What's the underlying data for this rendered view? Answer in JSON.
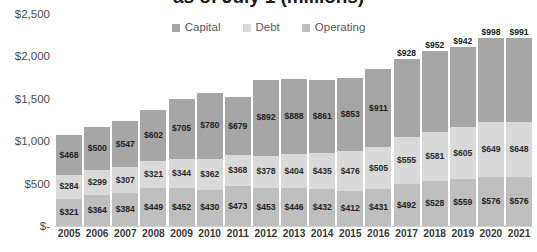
{
  "chart_data": {
    "type": "bar",
    "stacked": true,
    "title": "as of July 1 (millions)",
    "xlabel": "",
    "ylabel": "",
    "ylim": [
      0,
      2500
    ],
    "yticks": [
      0,
      500,
      1000,
      1500,
      2000,
      2500
    ],
    "ytick_labels": [
      "$-",
      "$500",
      "$1,000",
      "$1,500",
      "$2,000",
      "$2,500"
    ],
    "grid": false,
    "legend_position": "top-center",
    "categories": [
      "2005",
      "2006",
      "2007",
      "2008",
      "2009",
      "2010",
      "2011",
      "2012",
      "2013",
      "2014",
      "2015",
      "2016",
      "2017",
      "2018",
      "2019",
      "2020",
      "2021"
    ],
    "series": [
      {
        "name": "Operating",
        "color": "#bfbfbf",
        "values": [
          321,
          364,
          384,
          449,
          452,
          430,
          473,
          453,
          446,
          432,
          412,
          431,
          492,
          528,
          559,
          576,
          576
        ],
        "labels": [
          "$321",
          "$364",
          "$384",
          "$449",
          "$452",
          "$430",
          "$473",
          "$453",
          "$446",
          "$432",
          "$412",
          "$431",
          "$492",
          "$528",
          "$559",
          "$576",
          "$576"
        ]
      },
      {
        "name": "Debt",
        "color": "#d9d9d9",
        "values": [
          284,
          299,
          307,
          321,
          344,
          362,
          368,
          378,
          404,
          435,
          476,
          505,
          555,
          581,
          605,
          649,
          648
        ],
        "labels": [
          "$284",
          "$299",
          "$307",
          "$321",
          "$344",
          "$362",
          "$368",
          "$378",
          "$404",
          "$435",
          "$476",
          "$505",
          "$555",
          "$581",
          "$605",
          "$649",
          "$648"
        ]
      },
      {
        "name": "Capital",
        "color": "#a6a6a6",
        "values": [
          468,
          500,
          547,
          602,
          705,
          780,
          679,
          892,
          888,
          861,
          853,
          911,
          928,
          952,
          942,
          998,
          991
        ],
        "labels": [
          "$468",
          "$500",
          "$547",
          "$602",
          "$705",
          "$780",
          "$679",
          "$892",
          "$888",
          "$861",
          "$853",
          "$911",
          "$928",
          "$952",
          "$942",
          "$998",
          "$991"
        ]
      }
    ],
    "legend": [
      {
        "label": "Capital",
        "color": "#a6a6a6"
      },
      {
        "label": "Debt",
        "color": "#d9d9d9"
      },
      {
        "label": "Operating",
        "color": "#bfbfbf"
      }
    ]
  }
}
